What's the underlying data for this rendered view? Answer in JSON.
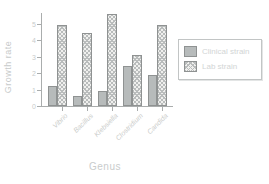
{
  "figure": {
    "background": "#ffffff",
    "text_color": "#c9cccc",
    "axis_color": "#aaadad",
    "solid_bar_color": "#b7bbbb",
    "hatch_line_color": "#b9bcbc",
    "bar_border_color": "#8f9292"
  },
  "chart_data": {
    "type": "bar",
    "title": "",
    "xlabel": "Genus",
    "ylabel": "Growth rate",
    "categories": [
      "Vibrio",
      "Bacillus",
      "Klebsiella",
      "Clostridium",
      "Candida"
    ],
    "series": [
      {
        "name": "Clinical strain",
        "pattern": "solid",
        "values": [
          1.2,
          0.6,
          0.9,
          2.4,
          1.9
        ]
      },
      {
        "name": "Lab strain",
        "pattern": "crosshatch",
        "values": [
          4.9,
          4.4,
          5.6,
          3.1,
          4.9
        ]
      }
    ],
    "yticks": [
      0,
      1,
      2,
      3,
      4,
      5
    ],
    "ylim": [
      0,
      5.7
    ],
    "grid": false,
    "legend_position": "right"
  }
}
